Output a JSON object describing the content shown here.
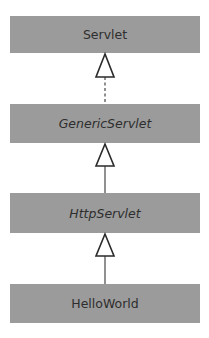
{
  "diagram": {
    "type": "uml-class-hierarchy",
    "classes": [
      {
        "id": "servlet",
        "name": "Servlet",
        "kind": "interface",
        "italic": false
      },
      {
        "id": "generic-servlet",
        "name": "GenericServlet",
        "kind": "abstract-class",
        "italic": true
      },
      {
        "id": "http-servlet",
        "name": "HttpServlet",
        "kind": "abstract-class",
        "italic": true
      },
      {
        "id": "hello-world",
        "name": "HelloWorld",
        "kind": "class",
        "italic": false
      }
    ],
    "relationships": [
      {
        "from": "GenericServlet",
        "to": "Servlet",
        "type": "realization",
        "line": "dashed",
        "arrowhead": "hollow-triangle"
      },
      {
        "from": "HttpServlet",
        "to": "GenericServlet",
        "type": "generalization",
        "line": "solid",
        "arrowhead": "hollow-triangle"
      },
      {
        "from": "HelloWorld",
        "to": "HttpServlet",
        "type": "generalization",
        "line": "solid",
        "arrowhead": "hollow-triangle"
      }
    ],
    "colors": {
      "box_fill": "#9b9b9b",
      "text": "#2e2e2e",
      "line": "#555555",
      "arrow_fill": "#ffffff",
      "background": "#ffffff"
    }
  }
}
